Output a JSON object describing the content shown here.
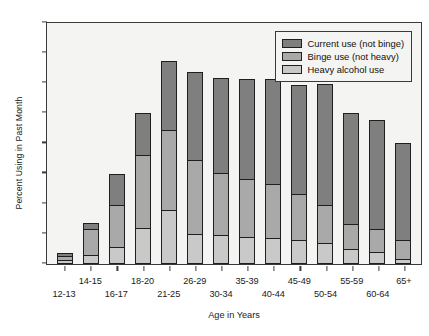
{
  "chart_data": {
    "type": "bar",
    "subtype": "stacked-vertical",
    "title": "",
    "xlabel": "Age in Years",
    "ylabel": "Percent Using in Past Month",
    "ylim": [
      0,
      80
    ],
    "yticks": [
      0,
      10,
      20,
      30,
      40,
      50,
      60,
      70,
      80
    ],
    "grid": false,
    "legend_position": "top-right",
    "stack_order_bottom_to_top": [
      "Heavy alcohol use",
      "Binge use (not heavy)",
      "Current use (not binge)"
    ],
    "categories": [
      "12-13",
      "14-15",
      "16-17",
      "18-20",
      "21-25",
      "26-29",
      "30-34",
      "35-39",
      "40-44",
      "45-49",
      "50-54",
      "55-59",
      "60-64",
      "65+"
    ],
    "series": [
      {
        "name": "Heavy alcohol use",
        "color": "#c9c9c9",
        "values": [
          1.5,
          3.0,
          5.5,
          12.0,
          18.0,
          10.0,
          9.5,
          9.0,
          8.5,
          8.0,
          7.0,
          5.0,
          4.0,
          1.5
        ]
      },
      {
        "name": "Binge use (not heavy)",
        "color": "#a9a9a9",
        "values": [
          1.5,
          9.0,
          14.5,
          24.5,
          27.0,
          25.0,
          21.0,
          19.5,
          18.5,
          15.5,
          13.0,
          8.5,
          8.0,
          7.0
        ]
      },
      {
        "name": "Current use (not binge)",
        "color": "#7f7f7f",
        "values": [
          1.5,
          2.5,
          10.5,
          14.5,
          23.0,
          29.5,
          32.0,
          33.5,
          35.0,
          36.5,
          40.5,
          37.5,
          36.5,
          32.5
        ]
      }
    ],
    "totals": [
      4.5,
      14.5,
      30.5,
      51.0,
      68.0,
      64.5,
      62.5,
      62.0,
      62.0,
      60.0,
      60.5,
      51.0,
      48.5,
      41.0
    ]
  },
  "legend": {
    "items": [
      {
        "label": "Current use (not binge)",
        "color": "#7f7f7f"
      },
      {
        "label": "Binge use (not heavy)",
        "color": "#a9a9a9"
      },
      {
        "label": "Heavy alcohol use",
        "color": "#c9c9c9"
      }
    ]
  },
  "axes": {
    "y_title": "Percent Using in Past Month",
    "x_title": "Age in Years"
  }
}
